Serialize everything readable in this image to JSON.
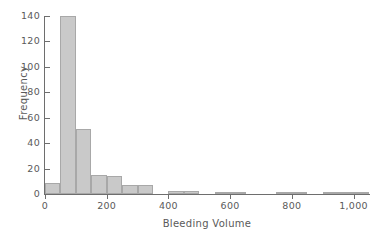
{
  "chart_data": {
    "type": "bar",
    "title": "",
    "subtitle": "",
    "xlabel": "Bleeding Volume",
    "ylabel": "Frequency",
    "xlim": [
      0,
      1050
    ],
    "ylim": [
      0,
      140
    ],
    "grid": false,
    "legend": null,
    "bin_width": 50,
    "bar_color": "#c9c9c9",
    "bar_edge_color": "#a8a8a8",
    "axis_color": "#6e6e6e",
    "text_color": "#5a5a5a",
    "xticks": [
      0,
      200,
      400,
      600,
      800,
      1000
    ],
    "xtick_labels": [
      "0",
      "200",
      "400",
      "600",
      "800",
      "1,000"
    ],
    "yticks": [
      0,
      20,
      40,
      60,
      80,
      100,
      120,
      140
    ],
    "ytick_labels": [
      "0",
      "20",
      "40",
      "60",
      "80",
      "100",
      "120",
      "140"
    ],
    "bins": [
      {
        "x0": 0,
        "x1": 50,
        "value": 9
      },
      {
        "x0": 50,
        "x1": 100,
        "value": 140
      },
      {
        "x0": 100,
        "x1": 150,
        "value": 51
      },
      {
        "x0": 150,
        "x1": 200,
        "value": 15
      },
      {
        "x0": 200,
        "x1": 250,
        "value": 14
      },
      {
        "x0": 250,
        "x1": 300,
        "value": 7
      },
      {
        "x0": 300,
        "x1": 350,
        "value": 7
      },
      {
        "x0": 350,
        "x1": 400,
        "value": 0
      },
      {
        "x0": 400,
        "x1": 450,
        "value": 2
      },
      {
        "x0": 450,
        "x1": 500,
        "value": 2
      },
      {
        "x0": 500,
        "x1": 550,
        "value": 0
      },
      {
        "x0": 550,
        "x1": 600,
        "value": 1
      },
      {
        "x0": 600,
        "x1": 650,
        "value": 1
      },
      {
        "x0": 650,
        "x1": 700,
        "value": 0
      },
      {
        "x0": 700,
        "x1": 750,
        "value": 0
      },
      {
        "x0": 750,
        "x1": 800,
        "value": 1
      },
      {
        "x0": 800,
        "x1": 850,
        "value": 1
      },
      {
        "x0": 850,
        "x1": 900,
        "value": 0
      },
      {
        "x0": 900,
        "x1": 950,
        "value": 1
      },
      {
        "x0": 950,
        "x1": 1000,
        "value": 1
      },
      {
        "x0": 1000,
        "x1": 1050,
        "value": 1
      }
    ]
  }
}
